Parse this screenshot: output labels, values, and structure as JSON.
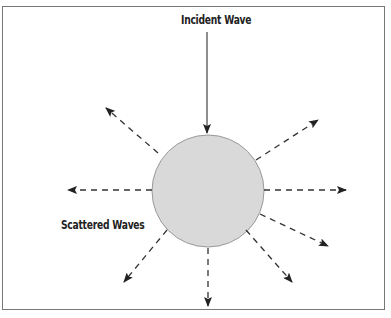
{
  "diagram": {
    "title_label": "Incident Wave",
    "scatter_label": "Scattered Waves",
    "colors": {
      "scatterer_fill": "#d9d9d9",
      "scatterer_stroke": "#999999",
      "arrow": "#333333",
      "border": "#777777"
    },
    "scatterer": {
      "shape": "circle",
      "cx": 208,
      "cy": 191,
      "r": 56
    }
  }
}
